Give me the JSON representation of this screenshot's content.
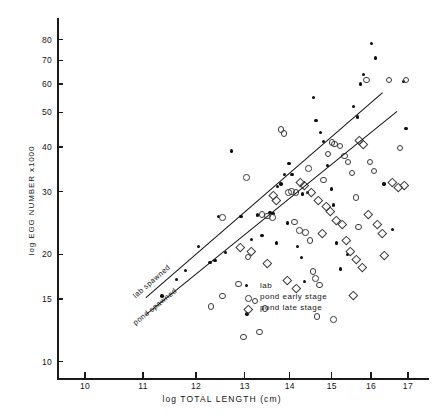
{
  "chart_data": {
    "type": "scatter",
    "title": "",
    "xlabel": "log  TOTAL  LENGTH (cm)",
    "ylabel": "log  EGG NUMBER  x1000",
    "xscale": "log",
    "yscale": "log",
    "xlim": [
      9.55,
      17.6
    ],
    "ylim": [
      9.0,
      92
    ],
    "xticks": [
      10,
      11,
      12,
      13,
      14,
      15,
      16,
      17
    ],
    "xtick_labels": [
      "10",
      "11",
      "12",
      "13",
      "14",
      "15",
      "16",
      "17"
    ],
    "yticks": [
      10,
      15,
      20,
      30,
      40,
      50,
      60,
      70,
      80
    ],
    "ytick_labels": [
      "10",
      "15",
      "20",
      "30",
      "40",
      "50",
      "60",
      "70",
      "80"
    ],
    "grid": false,
    "legend_position": "lower-right-inside",
    "series": [
      {
        "name": "lab",
        "marker": "filled-circle",
        "color": "#0d0d0d",
        "points": [
          [
            12.72,
            39.0
          ],
          [
            12.45,
            25.5
          ],
          [
            12.92,
            25.5
          ],
          [
            13.28,
            25.8
          ],
          [
            13.55,
            26.2
          ],
          [
            13.62,
            26.0
          ],
          [
            13.38,
            22.6
          ],
          [
            12.05,
            21.0
          ],
          [
            11.8,
            18.0
          ],
          [
            11.62,
            17.0
          ],
          [
            11.35,
            15.3
          ],
          [
            12.28,
            19.0
          ],
          [
            12.38,
            19.2
          ],
          [
            13.05,
            13.6
          ],
          [
            13.72,
            31.0
          ],
          [
            13.8,
            31.5
          ],
          [
            13.88,
            33.5
          ],
          [
            13.98,
            36.0
          ],
          [
            14.05,
            33.5
          ],
          [
            13.95,
            24.5
          ],
          [
            13.7,
            21.5
          ],
          [
            14.18,
            21.0
          ],
          [
            14.28,
            19.6
          ],
          [
            14.35,
            16.8
          ],
          [
            14.3,
            29.5
          ],
          [
            14.42,
            29.8
          ],
          [
            14.62,
            47.5
          ],
          [
            14.72,
            44.0
          ],
          [
            14.8,
            41.5
          ],
          [
            14.9,
            35.5
          ],
          [
            15.0,
            30.5
          ],
          [
            15.05,
            27.5
          ],
          [
            15.12,
            21.5
          ],
          [
            15.22,
            18.2
          ],
          [
            15.4,
            20.0
          ],
          [
            15.55,
            52.0
          ],
          [
            15.65,
            48.5
          ],
          [
            15.72,
            60.0
          ],
          [
            15.8,
            64.0
          ],
          [
            16.02,
            78.0
          ],
          [
            16.12,
            71.0
          ],
          [
            16.35,
            31.5
          ],
          [
            16.58,
            23.5
          ],
          [
            16.95,
            45.0
          ],
          [
            16.88,
            61.0
          ],
          [
            14.55,
            55.0
          ],
          [
            13.15,
            22.0
          ],
          [
            12.6,
            20.2
          ]
        ]
      },
      {
        "name": "pond early stage",
        "marker": "open-circle",
        "color": "#3a3a3a",
        "points": [
          [
            12.52,
            25.5
          ],
          [
            13.02,
            33.0
          ],
          [
            13.35,
            26.0
          ],
          [
            13.48,
            25.8
          ],
          [
            13.58,
            25.5
          ],
          [
            13.05,
            19.8
          ],
          [
            12.85,
            16.6
          ],
          [
            12.52,
            15.4
          ],
          [
            12.28,
            14.4
          ],
          [
            13.2,
            14.9
          ],
          [
            13.42,
            14.2
          ],
          [
            13.78,
            45.0
          ],
          [
            13.85,
            44.0
          ],
          [
            13.95,
            30.0
          ],
          [
            14.02,
            30.2
          ],
          [
            14.12,
            30.0
          ],
          [
            14.08,
            24.8
          ],
          [
            14.2,
            23.5
          ],
          [
            14.35,
            23.2
          ],
          [
            14.45,
            22.0
          ],
          [
            14.52,
            18.0
          ],
          [
            14.58,
            17.2
          ],
          [
            14.68,
            16.5
          ],
          [
            14.42,
            35.0
          ],
          [
            14.78,
            32.5
          ],
          [
            14.88,
            38.5
          ],
          [
            14.98,
            41.5
          ],
          [
            15.05,
            41.0
          ],
          [
            15.18,
            40.5
          ],
          [
            15.3,
            38.0
          ],
          [
            15.38,
            36.5
          ],
          [
            15.48,
            34.0
          ],
          [
            15.58,
            29.0
          ],
          [
            15.65,
            24.0
          ],
          [
            15.85,
            62.0
          ],
          [
            15.95,
            36.5
          ],
          [
            16.05,
            34.5
          ],
          [
            16.45,
            62.0
          ],
          [
            16.75,
            40.0
          ],
          [
            16.92,
            62.0
          ],
          [
            12.95,
            11.8
          ],
          [
            13.3,
            12.2
          ],
          [
            14.62,
            13.5
          ],
          [
            15.02,
            13.2
          ]
        ]
      },
      {
        "name": "pond late stage",
        "marker": "open-diamond",
        "color": "#3a3a3a",
        "points": [
          [
            12.88,
            21.0
          ],
          [
            13.12,
            20.5
          ],
          [
            13.6,
            29.5
          ],
          [
            13.68,
            28.5
          ],
          [
            14.22,
            32.0
          ],
          [
            14.32,
            31.5
          ],
          [
            14.48,
            30.0
          ],
          [
            14.65,
            28.5
          ],
          [
            14.85,
            27.5
          ],
          [
            14.95,
            26.5
          ],
          [
            15.1,
            25.0
          ],
          [
            15.25,
            24.5
          ],
          [
            15.35,
            22.0
          ],
          [
            15.45,
            20.5
          ],
          [
            15.6,
            19.5
          ],
          [
            15.75,
            18.5
          ],
          [
            15.9,
            26.0
          ],
          [
            16.15,
            24.5
          ],
          [
            16.28,
            23.0
          ],
          [
            16.55,
            32.0
          ],
          [
            16.7,
            31.0
          ],
          [
            16.88,
            31.5
          ],
          [
            13.92,
            17.0
          ],
          [
            14.12,
            16.2
          ],
          [
            15.52,
            15.5
          ],
          [
            16.32,
            20.0
          ],
          [
            14.75,
            23.0
          ],
          [
            15.68,
            42.0
          ],
          [
            15.78,
            41.0
          ],
          [
            13.48,
            19.0
          ]
        ]
      }
    ],
    "fit_lines": [
      {
        "label": "lab spawned",
        "x1": 11.05,
        "y1": 15.2,
        "x2": 16.3,
        "y2": 57.0
      },
      {
        "label": "pond spawned",
        "x1": 11.05,
        "y1": 13.6,
        "x2": 16.7,
        "y2": 50.5
      }
    ]
  },
  "legend": {
    "entries": [
      {
        "label": "lab",
        "marker": "filled-circle"
      },
      {
        "label": "pond  early  stage",
        "marker": "open-circle"
      },
      {
        "label": "pond  late  stage",
        "marker": "open-diamond"
      }
    ]
  }
}
